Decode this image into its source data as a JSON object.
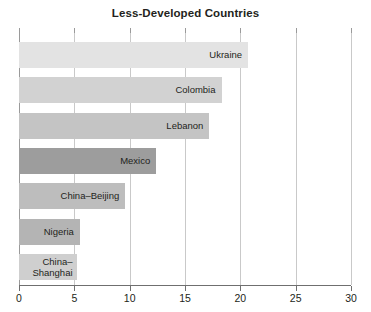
{
  "chart_data": {
    "type": "bar",
    "orientation": "horizontal",
    "title": "Less-Developed Countries",
    "xlabel": "",
    "ylabel": "",
    "xlim": [
      0,
      30
    ],
    "xticks": [
      0,
      5,
      10,
      15,
      20,
      25,
      30
    ],
    "xticklabels": [
      "0",
      "5",
      "10",
      "15",
      "20",
      "25",
      "30"
    ],
    "grid": "vertical",
    "legend": "none",
    "categories": [
      "Ukraine",
      "Colombia",
      "Lebanon",
      "Mexico",
      "China–Beijing",
      "Nigeria",
      "China–Shanghai"
    ],
    "values": [
      20.7,
      18.3,
      17.2,
      12.4,
      9.6,
      5.5,
      5.2
    ],
    "bar_colors": [
      "#e3e3e3",
      "#d2d2d2",
      "#c4c4c4",
      "#9d9d9d",
      "#bdbdbd",
      "#b4b4b4",
      "#cfcfcf"
    ],
    "bars": [
      {
        "label": "Ukraine",
        "value": 20.7,
        "color": "#e3e3e3",
        "two_line": false
      },
      {
        "label": "Colombia",
        "value": 18.3,
        "color": "#d2d2d2",
        "two_line": false
      },
      {
        "label": "Lebanon",
        "value": 17.2,
        "color": "#c4c4c4",
        "two_line": false
      },
      {
        "label": "Mexico",
        "value": 12.4,
        "color": "#9d9d9d",
        "two_line": false
      },
      {
        "label": "China–Beijing",
        "value": 9.6,
        "color": "#bdbdbd",
        "two_line": false
      },
      {
        "label": "Nigeria",
        "value": 5.5,
        "color": "#b4b4b4",
        "two_line": false
      },
      {
        "label": "China–Shanghai",
        "value": 5.2,
        "color": "#cfcfcf",
        "two_line": true
      }
    ]
  },
  "colors": {
    "gridline": "#c9c9c9",
    "axis": "#6f6f6f",
    "text": "#231f20",
    "background": "#ffffff"
  }
}
